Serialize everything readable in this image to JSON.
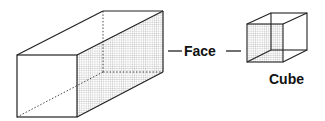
{
  "diagram": {
    "labels": {
      "face": "Face",
      "cube": "Cube"
    },
    "shapes": [
      {
        "name": "rectangular-prism",
        "shaded_face": "right-side"
      },
      {
        "name": "cube",
        "shaded_face": "front"
      }
    ],
    "colors": {
      "stroke": "#222222",
      "grid": "#9a9a9a",
      "background": "#ffffff"
    }
  }
}
